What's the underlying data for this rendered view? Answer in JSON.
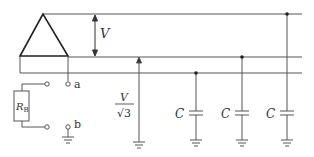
{
  "diagram": {
    "type": "three-phase circuit with line-to-ground capacitances",
    "labels": {
      "line_voltage": "V",
      "phase_voltage_num": "V",
      "phase_voltage_den": "√3",
      "resistor": "R",
      "resistor_sub": "B",
      "terminal_a": "a",
      "terminal_b": "b",
      "cap1": "C",
      "cap2": "C",
      "cap3": "C"
    },
    "colors": {
      "line": "#555555",
      "source": "#222222"
    }
  }
}
